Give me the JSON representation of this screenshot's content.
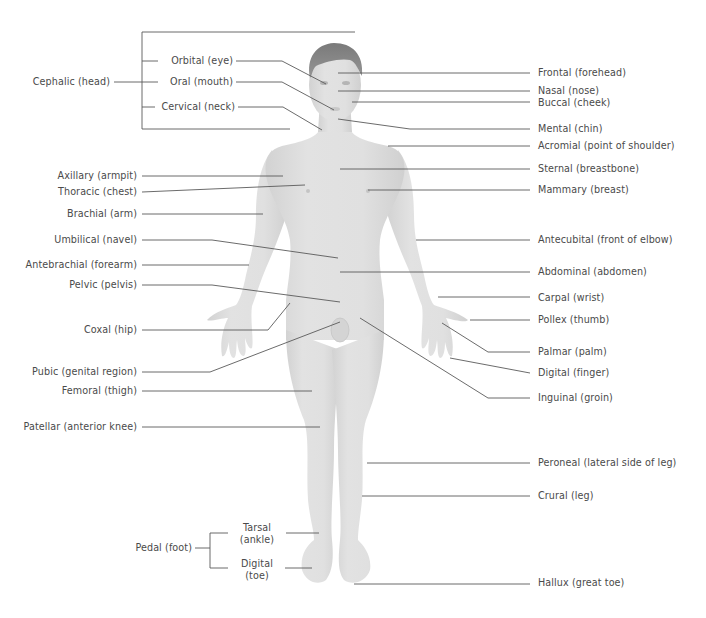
{
  "diagram": {
    "colors": {
      "background": "#ffffff",
      "skin": "#dedede",
      "skin_shadow": "#cfcfcf",
      "hair": "#8a8a8a",
      "leader_line": "#5a5a5a",
      "text": "#4a4a4a"
    },
    "groups": {
      "cephalic": {
        "label": "Cephalic (head)",
        "members": [
          "Orbital (eye)",
          "Oral (mouth)",
          "Cervical (neck)"
        ]
      },
      "pedal": {
        "label": "Pedal (foot)",
        "members": [
          "Tarsal (ankle)",
          "Digital (toe)"
        ]
      }
    },
    "left_labels": {
      "cephalic": "Cephalic (head)",
      "orbital": "Orbital (eye)",
      "oral": "Oral (mouth)",
      "cervical": "Cervical (neck)",
      "axillary": "Axillary (armpit)",
      "thoracic": "Thoracic (chest)",
      "brachial": "Brachial (arm)",
      "umbilical": "Umbilical (navel)",
      "antebrachial": "Antebrachial (forearm)",
      "pelvic": "Pelvic (pelvis)",
      "coxal": "Coxal (hip)",
      "pubic": "Pubic (genital region)",
      "femoral": "Femoral (thigh)",
      "patellar": "Patellar (anterior knee)",
      "pedal": "Pedal (foot)",
      "tarsal_1": "Tarsal",
      "tarsal_2": "(ankle)",
      "digital_toe_1": "Digital",
      "digital_toe_2": "(toe)"
    },
    "right_labels": {
      "frontal": "Frontal (forehead)",
      "nasal": "Nasal (nose)",
      "buccal": "Buccal (cheek)",
      "mental": "Mental (chin)",
      "acromial": "Acromial (point of shoulder)",
      "sternal": "Sternal (breastbone)",
      "mammary": "Mammary (breast)",
      "antecubital": "Antecubital (front of elbow)",
      "abdominal": "Abdominal (abdomen)",
      "carpal": "Carpal (wrist)",
      "pollex": "Pollex (thumb)",
      "palmar": "Palmar (palm)",
      "digital_finger": "Digital (finger)",
      "inguinal": "Inguinal (groin)",
      "peroneal": "Peroneal (lateral side of leg)",
      "crural": "Crural (leg)",
      "hallux": "Hallux (great toe)"
    }
  }
}
